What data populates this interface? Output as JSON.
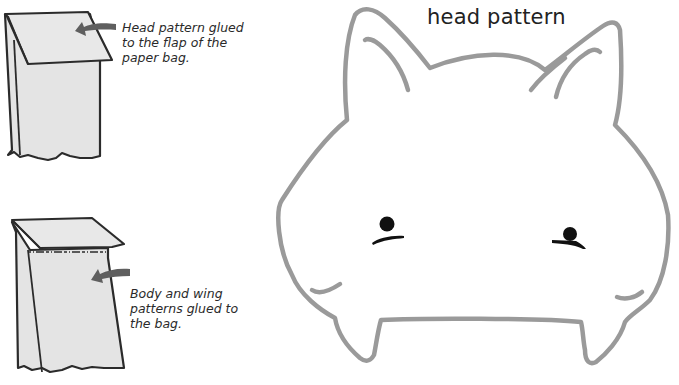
{
  "captions": {
    "head_flap": [
      "Head pattern glued",
      "to the flap of the",
      "paper bag."
    ],
    "body_bag": [
      "Body and wing",
      "patterns glued to",
      "the bag."
    ]
  },
  "head_pattern": {
    "title": "head pattern"
  },
  "colors": {
    "outline_gray": "#9a9a9a",
    "bag_fill": "#e4e4e4",
    "bag_stroke": "#2b2b2b",
    "arrow_fill": "#5f5f5f",
    "eye": "#111111"
  }
}
